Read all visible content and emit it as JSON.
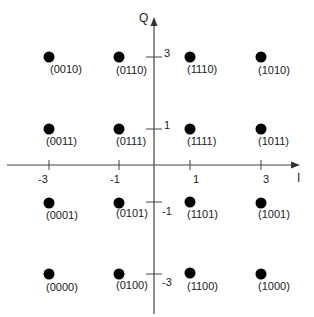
{
  "diagram": {
    "type": "16-QAM constellation",
    "axes": {
      "x_label": "I",
      "y_label": "Q",
      "x_ticks": [
        {
          "value": -3,
          "label": "-3"
        },
        {
          "value": -1,
          "label": "-1"
        },
        {
          "value": 1,
          "label": "1"
        },
        {
          "value": 3,
          "label": "3"
        }
      ],
      "y_ticks": [
        {
          "value": 3,
          "label": "3"
        },
        {
          "value": 1,
          "label": "1"
        },
        {
          "value": -1,
          "label": "-1"
        },
        {
          "value": -3,
          "label": "-3"
        }
      ]
    },
    "points": [
      {
        "i": -3,
        "q": 3,
        "label": "(0010)"
      },
      {
        "i": -1,
        "q": 3,
        "label": "(0110)"
      },
      {
        "i": 1,
        "q": 3,
        "label": "(1110)"
      },
      {
        "i": 3,
        "q": 3,
        "label": "(1010)"
      },
      {
        "i": -3,
        "q": 1,
        "label": "(0011)"
      },
      {
        "i": -1,
        "q": 1,
        "label": "(0111)"
      },
      {
        "i": 1,
        "q": 1,
        "label": "(1111)"
      },
      {
        "i": 3,
        "q": 1,
        "label": "(1011)"
      },
      {
        "i": -3,
        "q": -1,
        "label": "(0001)"
      },
      {
        "i": -1,
        "q": -1,
        "label": "(0101)"
      },
      {
        "i": 1,
        "q": -1,
        "label": "(1101)"
      },
      {
        "i": 3,
        "q": -1,
        "label": "(1001)"
      },
      {
        "i": -3,
        "q": -3,
        "label": "(0000)"
      },
      {
        "i": -1,
        "q": -3,
        "label": "(0100)"
      },
      {
        "i": 1,
        "q": -3,
        "label": "(1100)"
      },
      {
        "i": 3,
        "q": -3,
        "label": "(1000)"
      }
    ],
    "colors": {
      "axis": "#444444",
      "point": "#000000",
      "text": "#1a1a1a"
    }
  }
}
